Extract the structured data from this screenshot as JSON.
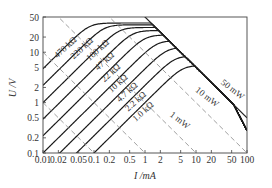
{
  "chart_data": {
    "type": "line",
    "title": "",
    "xlabel": "I /mA",
    "ylabel": "U /V",
    "xscale": "log",
    "yscale": "log",
    "xlim": [
      0.01,
      100
    ],
    "ylim": [
      0.1,
      50
    ],
    "x_ticks": [
      "0.01",
      "0.02",
      "0.05",
      "0.1",
      "0.2",
      "0.5",
      "1",
      "2",
      "5",
      "10",
      "20",
      "50",
      "100"
    ],
    "y_ticks": [
      "0.1",
      "0.2",
      "0.5",
      "1",
      "2",
      "5",
      "10",
      "20",
      "50"
    ],
    "x_tick_values": [
      0.01,
      0.02,
      0.05,
      0.1,
      0.2,
      0.5,
      1,
      2,
      5,
      10,
      20,
      50,
      100
    ],
    "y_tick_values": [
      0.1,
      0.2,
      0.5,
      1,
      2,
      5,
      10,
      20,
      50
    ],
    "grid": false,
    "series": [
      {
        "name": "470 kΩ",
        "r_kohm": 470,
        "u_max": 38,
        "label_pos": [
          0.019,
          7.5
        ]
      },
      {
        "name": "220 kΩ",
        "r_kohm": 220,
        "u_max": 35,
        "label_pos": [
          0.04,
          7.2
        ]
      },
      {
        "name": "100 kΩ",
        "r_kohm": 100,
        "u_max": 31,
        "label_pos": [
          0.082,
          6.6
        ]
      },
      {
        "name": "47 kΩ",
        "r_kohm": 47,
        "u_max": 27,
        "label_pos": [
          0.12,
          4.3
        ]
      },
      {
        "name": "22 kΩ",
        "r_kohm": 22,
        "u_max": 22,
        "label_pos": [
          0.16,
          2.5
        ]
      },
      {
        "name": "10 kΩ",
        "r_kohm": 10,
        "u_max": 17,
        "label_pos": [
          0.22,
          1.55
        ]
      },
      {
        "name": "4.7 kΩ",
        "r_kohm": 4.7,
        "u_max": 12.5,
        "label_pos": [
          0.32,
          1.0
        ]
      },
      {
        "name": "2.2 kΩ",
        "r_kohm": 2.2,
        "u_max": 8.5,
        "label_pos": [
          0.47,
          0.66
        ]
      },
      {
        "name": "1.0 kΩ",
        "r_kohm": 1.0,
        "u_max": 5.5,
        "label_pos": [
          0.66,
          0.41
        ]
      }
    ],
    "power_lines": [
      {
        "name": "50 mW",
        "p_mw": 50,
        "style": "solid",
        "label_pos": [
          30,
          2.4
        ]
      },
      {
        "name": "10 mW",
        "p_mw": 10,
        "style": "dashed",
        "label_pos": [
          9.5,
          1.7
        ]
      },
      {
        "name": "1 mW",
        "p_mw": 1,
        "style": "dashed",
        "label_pos": [
          3,
          0.55
        ]
      }
    ],
    "extra_dashed_lines_mw": [
      0.1,
      0.01
    ]
  }
}
